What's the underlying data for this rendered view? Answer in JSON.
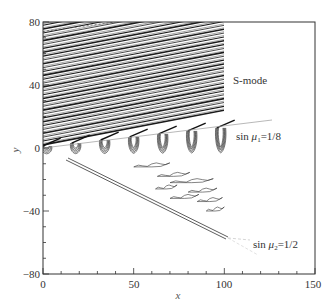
{
  "chart_data": {
    "type": "contour",
    "title": "",
    "xlabel": "x",
    "ylabel": "y",
    "xlim": [
      0,
      150
    ],
    "ylim": [
      -80,
      80
    ],
    "xticks": [
      0,
      50,
      100,
      150
    ],
    "yticks": [
      -80,
      -40,
      0,
      40,
      80
    ],
    "x_minor_step": 10,
    "y_minor_step": 10,
    "grid": false,
    "data_extent_x": [
      0,
      100
    ],
    "annotations": [
      {
        "text": "S-mode",
        "x": 103,
        "y": 45
      },
      {
        "text": "sin μ₁=1/8",
        "x": 103,
        "y": 10,
        "line": {
          "from": [
            0,
            0
          ],
          "to": [
            126,
            18
          ]
        }
      },
      {
        "text": "sin μ₂=1/2",
        "x": 112,
        "y": -64,
        "line": {
          "from": [
            13,
            -8
          ],
          "to": [
            102,
            -58
          ]
        }
      }
    ],
    "features": {
      "oblique_stripes": {
        "region": "y > x·tan(μ₁), x∈[0,100]",
        "slope": 0.126,
        "count_approx": 30
      },
      "streamwise_structures_x": [
        2,
        18,
        34,
        50,
        66,
        82,
        98
      ],
      "wedge_line": "Mach line sin μ₂ = 1/2 bounding lower region"
    }
  },
  "labels": {
    "x_axis": "x",
    "y_axis": "y",
    "xtick": [
      "0",
      "50",
      "100",
      "150"
    ],
    "ytick": [
      "80",
      "40",
      "0",
      "−40",
      "−80"
    ],
    "s_mode": "S-mode",
    "mu1_prefix": "sin ",
    "mu1_sym": "μ",
    "mu1_sub": "1",
    "mu1_eq": "=1/8",
    "mu2_prefix": "sin ",
    "mu2_sym": "μ",
    "mu2_sub": "2",
    "mu2_eq": "=1/2"
  },
  "colors": {
    "ink": "#222222",
    "axis": "#333333",
    "stripe": "#1a1a1a",
    "light_line": "#999999"
  }
}
